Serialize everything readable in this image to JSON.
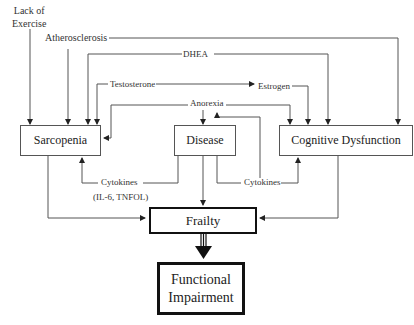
{
  "diagram": {
    "factors": {
      "lack_of_exercise": [
        "Lack of",
        "Exercise"
      ],
      "atherosclerosis": "Atherosclerosis",
      "dhea": "DHEA",
      "testosterone": "Testosterone",
      "estrogen": "Estrogen",
      "anorexia": "Anorexia",
      "cytokines_left": "Cytokines",
      "cytokines_left_detail": "(IL-6, TNFOL)",
      "cytokines_right": "Cytokines"
    },
    "boxes": {
      "sarcopenia": "Sarcopenia",
      "disease": "Disease",
      "cognitive_dysfunction": "Cognitive Dysfunction",
      "frailty": "Frailty",
      "functional_impairment": [
        "Functional",
        "Impairment"
      ]
    },
    "edges": [
      {
        "from": "Lack of Exercise",
        "to": "Sarcopenia"
      },
      {
        "from": "Atherosclerosis",
        "to": "Sarcopenia"
      },
      {
        "from": "Atherosclerosis",
        "to": "Cognitive Dysfunction"
      },
      {
        "from": "DHEA",
        "to": "Sarcopenia"
      },
      {
        "from": "DHEA",
        "to": "Cognitive Dysfunction"
      },
      {
        "from": "Testosterone",
        "to": "Sarcopenia"
      },
      {
        "from": "Testosterone",
        "to": "Estrogen"
      },
      {
        "from": "Estrogen",
        "to": "Cognitive Dysfunction"
      },
      {
        "from": "Anorexia",
        "to": "Sarcopenia"
      },
      {
        "from": "Anorexia",
        "to": "Disease"
      },
      {
        "from": "Anorexia",
        "to": "Cognitive Dysfunction"
      },
      {
        "from": "Disease",
        "to": "Anorexia"
      },
      {
        "from": "Disease",
        "to": "Sarcopenia",
        "via": "Cytokines (IL-6, TNFOL)"
      },
      {
        "from": "Disease",
        "to": "Cognitive Dysfunction",
        "via": "Cytokines"
      },
      {
        "from": "Disease",
        "to": "Frailty"
      },
      {
        "from": "Sarcopenia",
        "to": "Frailty"
      },
      {
        "from": "Cognitive Dysfunction",
        "to": "Frailty"
      },
      {
        "from": "Frailty",
        "to": "Functional Impairment",
        "style": "bold"
      }
    ],
    "colors": {
      "line": "#555555",
      "thick_border": "#111111",
      "background": "#ffffff"
    }
  }
}
